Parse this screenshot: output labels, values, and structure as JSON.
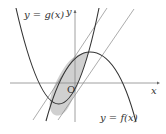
{
  "diagram": {
    "type": "function-graph",
    "labels": {
      "g_curve": "y = g(x)",
      "f_curve": "y = f(x)",
      "x_axis": "x",
      "y_axis": "y",
      "origin": "O"
    },
    "colors": {
      "curve": "#333333",
      "line": "#777777",
      "axis": "#888888",
      "shaded_region": "#d0d0d0"
    }
  }
}
